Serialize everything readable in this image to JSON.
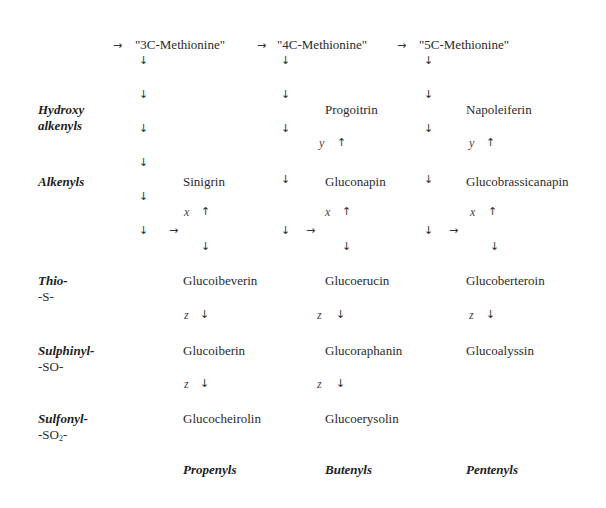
{
  "precursors": [
    "\"3C-Methionine\"",
    "\"4C-Methionine\"",
    "\"5C-Methionine\""
  ],
  "row_labels": {
    "hydroxy_alkenyls": [
      "Hydroxy",
      "alkenyls"
    ],
    "alkenyls": "Alkenyls",
    "thio": [
      "Thio-",
      "-S-"
    ],
    "sulphinyl": [
      "Sulphinyl-",
      "-SO-"
    ],
    "sulfonyl": [
      "Sulfonyl-",
      "-SO",
      "2",
      "-"
    ]
  },
  "hydroxy_alkenyls": {
    "c3": "",
    "c4": "Progoitrin",
    "c5": "Napoleiferin"
  },
  "alkenyls": {
    "c3": "Sinigrin",
    "c4": "Gluconapin",
    "c5": "Glucobrassicanapin"
  },
  "thio": {
    "c3": "Glucoibeverin",
    "c4": "Glucoerucin",
    "c5": "Glucoberteroin"
  },
  "sulphinyl": {
    "c3": "Glucoiberin",
    "c4": "Glucoraphanin",
    "c5": "Glucoalyssin"
  },
  "sulfonyl": {
    "c3": "Glucocheirolin",
    "c4": "Glucoerysolin",
    "c5": ""
  },
  "column_labels": [
    "Propenyls",
    "Butenyls",
    "Pentenyls"
  ],
  "enzyme_labels": {
    "x": "x",
    "y": "y",
    "z": "z"
  },
  "arrows": {
    "right": "→",
    "down": "↓",
    "up": "↑"
  }
}
